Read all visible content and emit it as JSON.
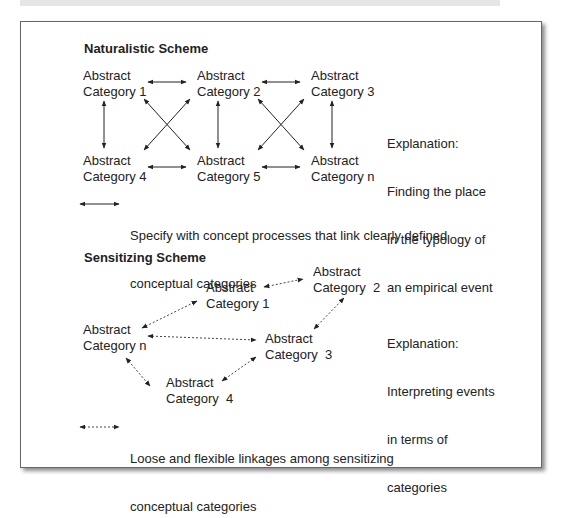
{
  "naturalistic": {
    "title": "Naturalistic Scheme",
    "nodes": [
      {
        "l1": "Abstract",
        "l2": "Category 1"
      },
      {
        "l1": "Abstract",
        "l2": "Category 2"
      },
      {
        "l1": "Abstract",
        "l2": "Category 3"
      },
      {
        "l1": "Abstract",
        "l2": "Category 4"
      },
      {
        "l1": "Abstract",
        "l2": "Category 5"
      },
      {
        "l1": "Abstract",
        "l2": "Category n"
      }
    ],
    "explanation": [
      "Explanation:",
      "Finding the place",
      "in the typology of",
      "an empirical event"
    ],
    "legend": [
      "Specify with concept processes that link clearly defined",
      "conceptual categories"
    ]
  },
  "sensitizing": {
    "title": "Sensitizing Scheme",
    "nodes": [
      {
        "l1": "Abstract",
        "l2": "Category 1"
      },
      {
        "l1": "Abstract",
        "l2": "Category  2"
      },
      {
        "l1": "Abstract",
        "l2": "Category n"
      },
      {
        "l1": "Abstract",
        "l2": "Category  3"
      },
      {
        "l1": "Abstract",
        "l2": "Category  4"
      }
    ],
    "explanation": [
      "Explanation:",
      "Interpreting events",
      "in terms of",
      "categories"
    ],
    "legend": [
      "Loose and flexible linkages among sensitizing",
      "conceptual categories"
    ]
  },
  "colors": {
    "line": "#222222",
    "frame": "#666666"
  }
}
